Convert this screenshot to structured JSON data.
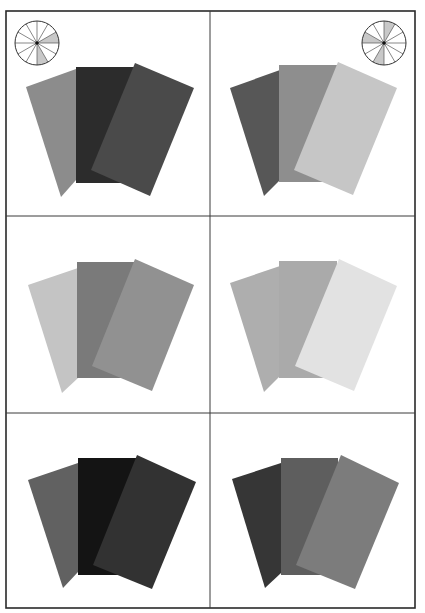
{
  "figure": {
    "frame": {
      "left": 6,
      "top": 11,
      "right": 415,
      "bottom": 608,
      "stroke": "#2a2a2a"
    },
    "dividers": {
      "vertical_x": 210,
      "horizontal_y": [
        216,
        413
      ],
      "stroke": "#3a3a3a"
    },
    "wheels": [
      {
        "name": "left-harmony-wheel",
        "cx": 37,
        "cy": 43,
        "r": 22,
        "segments": 12,
        "shaded_segments": [
          2,
          5
        ],
        "shade_color": "#c8c8c8"
      },
      {
        "name": "right-harmony-wheel",
        "cx": 384,
        "cy": 43,
        "r": 22,
        "segments": 12,
        "shaded_segments": [
          0,
          6,
          9
        ],
        "shade_color": "#c8c8c8"
      }
    ],
    "panels": [
      {
        "name": "panel-top-left",
        "cards": [
          {
            "role": "left",
            "color": "#8c8c8c",
            "points": "26,87 76,69 76,180 61,197"
          },
          {
            "role": "middle",
            "color": "#2c2c2c",
            "points": "76,67 134,67 134,183 76,183"
          },
          {
            "role": "right",
            "color": "#4a4a4a",
            "points": "135,63 194,88 150,196 91,170"
          }
        ]
      },
      {
        "name": "panel-top-right",
        "cards": [
          {
            "role": "left",
            "color": "#575757",
            "points": "230,88 280,70 280,180 264,196"
          },
          {
            "role": "middle",
            "color": "#8e8e8e",
            "points": "279,65 337,65 337,182 279,182"
          },
          {
            "role": "right",
            "color": "#c6c6c6",
            "points": "338,62 397,88 353,195 294,170"
          }
        ]
      },
      {
        "name": "panel-middle-left",
        "cards": [
          {
            "role": "left",
            "color": "#c4c4c4",
            "points": "28,285 78,268 78,378 62,393"
          },
          {
            "role": "middle",
            "color": "#7a7a7a",
            "points": "77,262 134,262 134,378 77,378"
          },
          {
            "role": "right",
            "color": "#919191",
            "points": "135,259 194,285 152,391 92,366"
          }
        ]
      },
      {
        "name": "panel-middle-right",
        "cards": [
          {
            "role": "left",
            "color": "#aeaeae",
            "points": "230,283 280,266 280,376 264,392"
          },
          {
            "role": "middle",
            "color": "#aaaaaa",
            "points": "279,261 337,261 337,378 279,378"
          },
          {
            "role": "right",
            "color": "#e2e2e2",
            "points": "339,259 397,286 354,391 295,366"
          }
        ]
      },
      {
        "name": "panel-bottom-left",
        "cards": [
          {
            "role": "left",
            "color": "#616161",
            "points": "28,480 78,463 78,572 63,588"
          },
          {
            "role": "middle",
            "color": "#141414",
            "points": "78,458 136,458 136,575 78,575"
          },
          {
            "role": "right",
            "color": "#323232",
            "points": "137,455 196,482 152,589 93,565"
          }
        ]
      },
      {
        "name": "panel-bottom-right",
        "cards": [
          {
            "role": "left",
            "color": "#363636",
            "points": "232,479 281,463 281,573 265,588"
          },
          {
            "role": "middle",
            "color": "#5e5e5e",
            "points": "281,458 338,458 338,575 281,575"
          },
          {
            "role": "right",
            "color": "#7c7c7c",
            "points": "341,455 399,483 355,589 296,565"
          }
        ]
      }
    ]
  }
}
